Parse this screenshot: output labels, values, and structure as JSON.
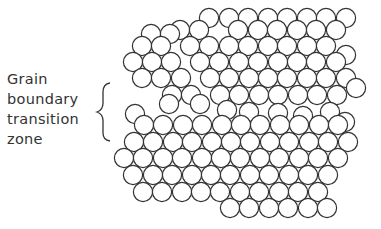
{
  "label": {
    "lines": [
      "Grain",
      "boundary",
      "transition",
      "zone"
    ]
  },
  "colors": {
    "stroke": "#333333",
    "background": "#ffffff",
    "text": "#333333"
  },
  "circle_radius": 9.6,
  "upper_grain": {
    "rows": [
      {
        "y": 18,
        "xs": [
          209,
          229,
          248,
          268,
          287,
          307,
          326,
          346
        ]
      },
      {
        "y": 30,
        "xs": [
          180,
          199,
          238,
          258,
          277,
          297,
          316,
          336
        ]
      },
      {
        "y": 34,
        "xs": [
          151,
          170
        ]
      },
      {
        "y": 46,
        "xs": [
          142,
          161,
          190,
          209,
          229,
          248,
          268,
          287,
          307,
          326
        ]
      },
      {
        "y": 55,
        "xs": [
          346
        ]
      },
      {
        "y": 62,
        "xs": [
          133,
          152,
          171,
          200,
          219,
          239,
          258,
          278,
          297,
          316,
          336
        ]
      },
      {
        "y": 78,
        "xs": [
          142,
          161,
          181,
          210,
          229,
          249,
          268,
          287,
          307,
          326,
          346
        ]
      },
      {
        "y": 88,
        "xs": [
          356
        ]
      },
      {
        "y": 95,
        "xs": [
          172,
          191,
          220,
          239,
          259,
          278,
          298,
          317,
          337
        ]
      }
    ]
  },
  "boundary_zone": {
    "circles": [
      {
        "x": 169,
        "y": 104
      },
      {
        "x": 200,
        "y": 104
      },
      {
        "x": 227,
        "y": 110
      },
      {
        "x": 249,
        "y": 112
      },
      {
        "x": 278,
        "y": 113
      },
      {
        "x": 303,
        "y": 116
      },
      {
        "x": 330,
        "y": 112
      },
      {
        "x": 345,
        "y": 122
      },
      {
        "x": 135,
        "y": 114
      }
    ]
  },
  "lower_grain": {
    "rows": [
      {
        "y": 125,
        "xs": [
          144,
          163,
          183,
          202,
          222,
          241,
          260,
          280,
          299,
          319,
          338
        ]
      },
      {
        "y": 142,
        "xs": [
          134,
          153,
          173,
          192,
          212,
          231,
          250,
          270,
          289,
          309,
          328,
          348
        ]
      },
      {
        "y": 158,
        "xs": [
          124,
          143,
          163,
          182,
          202,
          221,
          240,
          260,
          279,
          299,
          318,
          338
        ]
      },
      {
        "y": 175,
        "xs": [
          133,
          153,
          172,
          192,
          211,
          230,
          250,
          269,
          289,
          308,
          328
        ]
      },
      {
        "y": 192,
        "xs": [
          143,
          162,
          182,
          201,
          220,
          240,
          259,
          279,
          298,
          318
        ]
      },
      {
        "y": 208,
        "xs": [
          230,
          249,
          269,
          288,
          308,
          327
        ]
      }
    ]
  }
}
